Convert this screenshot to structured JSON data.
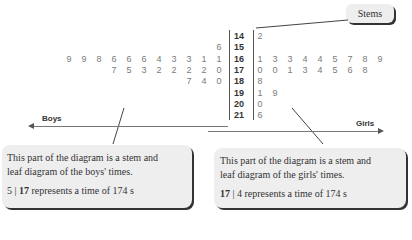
{
  "stems_callout": {
    "label": "Stems"
  },
  "stems": [
    "14",
    "15",
    "16",
    "17",
    "18",
    "19",
    "20",
    "21"
  ],
  "boys_leaves": [
    [],
    [
      "6"
    ],
    [
      "9",
      "9",
      "8",
      "6",
      "6",
      "6",
      "4",
      "3",
      "3",
      "1",
      "1"
    ],
    [
      "7",
      "5",
      "3",
      "2",
      "2",
      "2",
      "2",
      "0"
    ],
    [
      "7",
      "4",
      "0"
    ],
    [],
    [],
    []
  ],
  "girls_leaves": [
    [
      "2"
    ],
    [],
    [
      "1",
      "3",
      "3",
      "4",
      "4",
      "5",
      "7",
      "8",
      "9"
    ],
    [
      "0",
      "0",
      "1",
      "3",
      "4",
      "5",
      "6",
      "8"
    ],
    [
      "8"
    ],
    [
      "1",
      "9"
    ],
    [
      "0"
    ],
    [
      "6"
    ]
  ],
  "axis": {
    "left_label": "Boys",
    "right_label": "Girls"
  },
  "boys_callout": {
    "line1": "This part of the diagram is a stem and",
    "line2": "leaf diagram of the boys' times.",
    "key_leaf": "5",
    "key_sep": "|",
    "key_stem": "17",
    "key_text": "represents a time of 174 s"
  },
  "girls_callout": {
    "line1": "This part of the diagram is a stem and",
    "line2": "leaf diagram of the girls' times.",
    "key_stem": "17",
    "key_sep": "|",
    "key_leaf": "4",
    "key_text": "represents a time of 174 s"
  }
}
